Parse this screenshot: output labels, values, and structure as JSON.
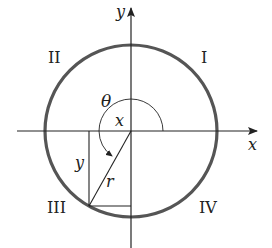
{
  "diagram": {
    "type": "unit-circle-quadrant-III",
    "axes": {
      "x_label": "x",
      "y_label": "y"
    },
    "quadrants": {
      "q1": "I",
      "q2": "II",
      "q3": "III",
      "q4": "IV"
    },
    "angle_label": "θ",
    "segments": {
      "horizontal_leg": "x",
      "vertical_leg": "y",
      "radius": "r"
    },
    "colors": {
      "circle": "#555555",
      "lines": "#222222",
      "background": "#ffffff"
    }
  }
}
